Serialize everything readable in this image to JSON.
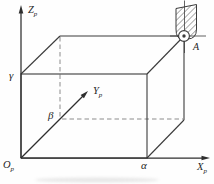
{
  "diagram": {
    "title_hint": "workpiece coordinate system box with tool at corner A",
    "colors": {
      "background": "#fefefe",
      "solid_line": "#3b3b3b",
      "hidden_line": "#8c8c8c",
      "axis_line": "#2e2e2e",
      "text": "#1f1f1f",
      "hatch": "#4a4a4a"
    },
    "axes": {
      "z": {
        "main": "Z",
        "sub": "p"
      },
      "y": {
        "main": "Y",
        "sub": "p"
      },
      "x": {
        "main": "X",
        "sub": "p"
      },
      "origin": {
        "main": "O",
        "sub": "p"
      }
    },
    "corner_labels": {
      "gamma": "γ",
      "beta": "β",
      "alpha": "α",
      "point_a": "A"
    },
    "icons": {
      "tool": "hatched-spindle-with-ball-tip"
    }
  }
}
